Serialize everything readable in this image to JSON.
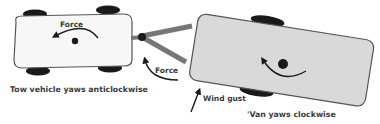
{
  "diagram": {
    "labels": {
      "force_tow": "Force",
      "force_hitch": "Force",
      "tow_caption": "Tow vehicle yaws anticlockwise",
      "wind": "Wind gust",
      "van_caption": "'Van yaws clockwise"
    },
    "colors": {
      "tow_body": "#f7f7f7",
      "van_body": "#d9d9d9",
      "outline": "#555555",
      "wheel": "#1a1a1a",
      "drawbar": "#777777"
    }
  }
}
